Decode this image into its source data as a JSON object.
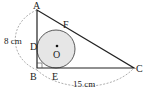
{
  "figure": {
    "labels": {
      "A": "A",
      "B": "B",
      "C": "C",
      "D": "D",
      "E": "E",
      "F": "F",
      "O": "O"
    },
    "measurements": {
      "AB": "8 cm",
      "BC": "15 cm"
    },
    "colors": {
      "line": "#222222",
      "circle_fill": "#e6e6e6",
      "dashed": "#999999"
    }
  }
}
